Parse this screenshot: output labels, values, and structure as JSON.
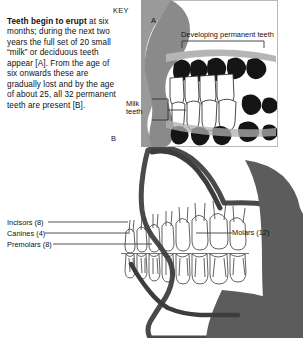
{
  "figure": {
    "key_label": "KEY",
    "markers": [
      {
        "id": "A",
        "label": "A"
      },
      {
        "id": "B",
        "label": "B"
      }
    ],
    "caption": {
      "lead": "Teeth begin to erupt",
      "body": " at six months; during the next two years the full set of 20 small “milk” or deciduous teeth appear [A]. From the age of six onwards these are gradually lost and by the age of about 25, all 32 permanent teeth are present [B]."
    },
    "annotations": {
      "developing_permanent_teeth": "Developing permanent teeth",
      "milk_teeth": "Milk teeth",
      "incisors": "Incisors (8)",
      "canines": "Canines (4)",
      "premolars": "Premolars (8)",
      "molars": "Molars (12)"
    },
    "colors": {
      "background": "#ffffff",
      "ink": "#111111",
      "silhouette_mid": "#8d8d8d",
      "silhouette_dark": "#4a4a4a",
      "tooth_dark": "#151515",
      "outline": "#2b2b2b",
      "border": "#b9b9b9"
    }
  }
}
